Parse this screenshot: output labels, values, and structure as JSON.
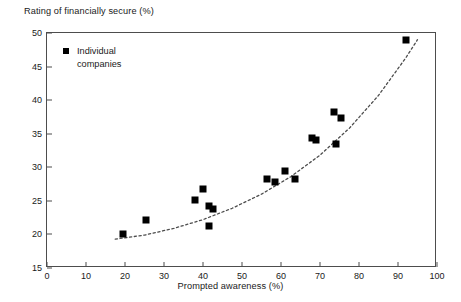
{
  "chart_data": {
    "type": "scatter",
    "title": "",
    "ylabel": "Rating of financially secure (%)",
    "xlabel": "Prompted awareness (%)",
    "xlim": [
      0,
      100
    ],
    "ylim": [
      15,
      50
    ],
    "xticks": [
      0,
      10,
      20,
      30,
      40,
      50,
      60,
      70,
      80,
      90,
      100
    ],
    "yticks": [
      15,
      20,
      25,
      30,
      35,
      40,
      45,
      50
    ],
    "grid": false,
    "legend_position": "top-left",
    "series": [
      {
        "name": "Individual\ncompanies",
        "marker": "filled-square",
        "color": "#000000",
        "points": [
          {
            "x": 19.5,
            "y": 20.1
          },
          {
            "x": 25.5,
            "y": 22.2
          },
          {
            "x": 38.0,
            "y": 25.2
          },
          {
            "x": 40.0,
            "y": 26.7
          },
          {
            "x": 41.5,
            "y": 24.2
          },
          {
            "x": 42.5,
            "y": 23.8
          },
          {
            "x": 41.5,
            "y": 21.2
          },
          {
            "x": 56.5,
            "y": 28.3
          },
          {
            "x": 58.5,
            "y": 27.8
          },
          {
            "x": 61.0,
            "y": 29.4
          },
          {
            "x": 63.5,
            "y": 28.3
          },
          {
            "x": 68.0,
            "y": 34.3
          },
          {
            "x": 69.0,
            "y": 34.0
          },
          {
            "x": 74.0,
            "y": 33.4
          },
          {
            "x": 73.5,
            "y": 38.3
          },
          {
            "x": 75.5,
            "y": 37.4
          },
          {
            "x": 92.0,
            "y": 49.0
          }
        ]
      }
    ],
    "trendline": {
      "style": "dashed",
      "color": "#4d4d4d",
      "points": [
        {
          "x": 17.5,
          "y": 19.3
        },
        {
          "x": 25.0,
          "y": 19.9
        },
        {
          "x": 32.5,
          "y": 20.9
        },
        {
          "x": 40.0,
          "y": 22.2
        },
        {
          "x": 47.5,
          "y": 23.9
        },
        {
          "x": 55.0,
          "y": 26.0
        },
        {
          "x": 62.5,
          "y": 28.6
        },
        {
          "x": 70.0,
          "y": 31.8
        },
        {
          "x": 77.5,
          "y": 35.8
        },
        {
          "x": 85.0,
          "y": 40.7
        },
        {
          "x": 92.0,
          "y": 46.3
        },
        {
          "x": 95.0,
          "y": 49.0
        }
      ]
    }
  },
  "legend": {
    "label": "Individual\ncompanies",
    "marker_name": "filled-square-marker"
  },
  "axes": {
    "y_title": "Rating of financially secure (%)",
    "x_title": "Prompted awareness (%)"
  }
}
